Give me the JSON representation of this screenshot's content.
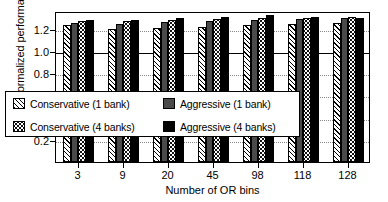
{
  "chart_data": {
    "type": "bar",
    "title": "",
    "xlabel": "Number of OR bins",
    "ylabel": "Normalized performance",
    "categories": [
      "3",
      "9",
      "20",
      "45",
      "98",
      "118",
      "128"
    ],
    "ylim": [
      0.0,
      1.36
    ],
    "yticks": [
      0.2,
      0.4,
      0.6,
      0.8,
      1.0,
      1.2
    ],
    "ytick_labels": [
      "0.2",
      "0.4",
      "0.6",
      "0.8",
      "1.0",
      "1.2"
    ],
    "reference_line": 1.0,
    "grid": true,
    "legend_position": "lower-left-inside",
    "series": [
      {
        "name": "Conservative (1 bank)",
        "pattern": "diagonal-hatch",
        "color": "#ffffff",
        "values": [
          1.23,
          1.2,
          1.21,
          1.22,
          1.23,
          1.24,
          1.25
        ]
      },
      {
        "name": "Aggressive (1 bank)",
        "pattern": "solid-gray",
        "color": "#4a4a4a",
        "values": [
          1.25,
          1.24,
          1.26,
          1.27,
          1.28,
          1.29,
          1.3
        ]
      },
      {
        "name": "Conservative (4 banks)",
        "pattern": "dotted",
        "color": "#ffffff",
        "values": [
          1.27,
          1.27,
          1.28,
          1.29,
          1.3,
          1.3,
          1.31
        ]
      },
      {
        "name": "Aggressive (4 banks)",
        "pattern": "solid-black",
        "color": "#000000",
        "values": [
          1.28,
          1.28,
          1.3,
          1.31,
          1.32,
          1.31,
          1.3
        ]
      }
    ]
  },
  "axis": {
    "ylabel": "Normalized performance",
    "xlabel": "Number of OR bins"
  },
  "legend": {
    "items": [
      {
        "label": "Conservative (1 bank)",
        "pattern": "diagonal-hatch"
      },
      {
        "label": "Aggressive (1 bank)",
        "pattern": "solid-gray"
      },
      {
        "label": "Conservative (4 banks)",
        "pattern": "dotted"
      },
      {
        "label": "Aggressive (4 banks)",
        "pattern": "solid-black"
      }
    ]
  }
}
